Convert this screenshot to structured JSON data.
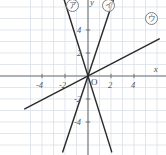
{
  "chart_data": {
    "type": "line",
    "title": "",
    "subtitle": "",
    "xlabel": "x",
    "ylabel": "y",
    "xlim": [
      -5.5,
      6.2
    ],
    "ylim": [
      -6.6,
      6.8
    ],
    "grid": true,
    "grid_step": 1,
    "legend_position": "inline-annotations",
    "origin_label": "O",
    "x_ticks": [
      {
        "value": -4,
        "label": "-4"
      },
      {
        "value": -2,
        "label": "-2"
      },
      {
        "value": 2,
        "label": "2"
      },
      {
        "value": 4,
        "label": "4"
      }
    ],
    "y_ticks": [
      {
        "value": 4,
        "label": "4"
      },
      {
        "value": 2,
        "label": "2"
      },
      {
        "value": -2,
        "label": "-2"
      },
      {
        "value": -4,
        "label": "-4"
      }
    ],
    "series": [
      {
        "name": "line-a",
        "annotation": "ア",
        "slope": -3.2,
        "intercept": 0,
        "through_origin": true,
        "color": "#2b2b2b",
        "label_x": -1.35,
        "label_y": 6.1
      },
      {
        "name": "line-i",
        "annotation": "イ",
        "slope": 3.0,
        "intercept": 0,
        "through_origin": true,
        "color": "#2b2b2b",
        "label_x": 1.75,
        "label_y": 6.1
      },
      {
        "name": "line-u",
        "annotation": "ウ",
        "slope": 0.52,
        "intercept": 0,
        "through_origin": true,
        "color": "#2b2b2b",
        "label_x": 5.5,
        "label_y": 5.0
      }
    ]
  },
  "annotations": {
    "tag_a": "ア",
    "tag_i": "イ",
    "tag_u": "ウ"
  },
  "axis": {
    "x_name": "x",
    "y_name": "y",
    "origin": "O"
  }
}
